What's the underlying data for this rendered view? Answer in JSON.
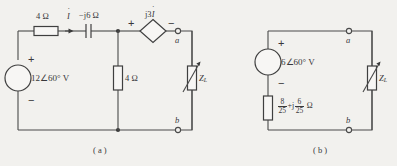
{
  "figure": {
    "type": "circuit-diagram",
    "panels": [
      {
        "id": "a",
        "caption": "( a )",
        "source": {
          "kind": "independent-voltage-source",
          "label": "12∠60° V",
          "plus": "+",
          "minus": "−"
        },
        "components": [
          {
            "id": "r-series",
            "kind": "resistor",
            "label": "4 Ω"
          },
          {
            "id": "c-series",
            "kind": "capacitor",
            "label": "−j6 Ω"
          },
          {
            "id": "r-shunt",
            "kind": "resistor",
            "label": "4 Ω"
          },
          {
            "id": "z-load",
            "kind": "variable-impedance",
            "label": "Z",
            "sublabel": "L"
          }
        ],
        "dependent_source": {
          "kind": "dependent-voltage-source",
          "label": "j3",
          "current_symbol": "I",
          "plus": "+",
          "minus": "−"
        },
        "current_label": "I",
        "terminals": [
          {
            "id": "a",
            "label": "a"
          },
          {
            "id": "b",
            "label": "b"
          }
        ]
      },
      {
        "id": "b",
        "caption": "( b )",
        "source": {
          "kind": "independent-voltage-source",
          "label": "6∠60° V",
          "plus": "+",
          "minus": "−"
        },
        "components": [
          {
            "id": "z-thevenin",
            "kind": "impedance",
            "fraction_real_num": "8",
            "fraction_real_den": "25",
            "operator": "+j",
            "fraction_imag_num": "6",
            "fraction_imag_den": "25",
            "unit": "Ω"
          },
          {
            "id": "z-load",
            "kind": "variable-impedance",
            "label": "Z",
            "sublabel": "L"
          }
        ],
        "terminals": [
          {
            "id": "a",
            "label": "a"
          },
          {
            "id": "b",
            "label": "b"
          }
        ]
      }
    ]
  },
  "colors": {
    "background": "#f2f1ee",
    "line": "#4a4a4a",
    "text": "#38373a",
    "component_fill": "#f7f6f4"
  }
}
